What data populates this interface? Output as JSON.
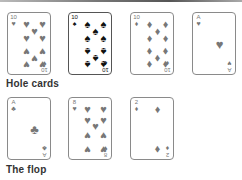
{
  "sections": {
    "hole_cards": {
      "label": "Hole cards"
    },
    "flop": {
      "label": "The flop"
    }
  },
  "row1": [
    {
      "rank": "10",
      "suit": "♥",
      "suit_name": "hearts"
    },
    {
      "rank": "10",
      "suit": "♠",
      "suit_name": "spades"
    },
    {
      "rank": "10",
      "suit": "♦",
      "suit_name": "diamonds"
    },
    {
      "rank": "A",
      "suit": "♥",
      "suit_name": "hearts"
    }
  ],
  "row2": [
    {
      "rank": "A",
      "suit": "♣",
      "suit_name": "clubs"
    },
    {
      "rank": "8",
      "suit": "♥",
      "suit_name": "hearts"
    },
    {
      "rank": "2",
      "suit": "♦",
      "suit_name": "diamonds"
    }
  ],
  "colors": {
    "pip": "#777777",
    "dark_pip": "#111111",
    "border": "#8a8a8a"
  }
}
